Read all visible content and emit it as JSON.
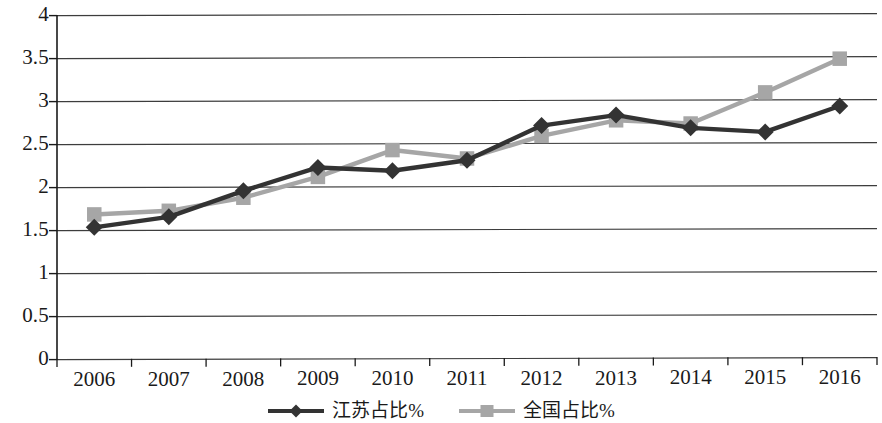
{
  "chart_data": {
    "type": "line",
    "title": "",
    "subtitle": "",
    "xlabel": "",
    "ylabel": "",
    "categories": [
      "2006",
      "2007",
      "2008",
      "2009",
      "2010",
      "2011",
      "2012",
      "2013",
      "2014",
      "2015",
      "2016"
    ],
    "ylim": [
      0,
      4
    ],
    "yticks": [
      "0",
      "0.5",
      "1",
      "1.5",
      "2",
      "2.5",
      "3",
      "3.5",
      "4"
    ],
    "ytick_values": [
      0,
      0.5,
      1,
      1.5,
      2,
      2.5,
      3,
      3.5,
      4
    ],
    "grid": true,
    "grid_axis": "y",
    "legend_position": "bottom",
    "series": [
      {
        "name": "江苏占比%",
        "color": "#333333",
        "marker": "diamond",
        "values": [
          1.53,
          1.65,
          1.95,
          2.22,
          2.18,
          2.3,
          2.7,
          2.82,
          2.67,
          2.62,
          2.92
        ]
      },
      {
        "name": "全国占比%",
        "color": "#a6a6a6",
        "marker": "square",
        "values": [
          1.68,
          1.72,
          1.87,
          2.11,
          2.42,
          2.32,
          2.58,
          2.76,
          2.72,
          3.08,
          3.47
        ]
      }
    ]
  },
  "axes": {
    "y": {
      "ticks": [
        "4",
        "3.5",
        "3",
        "2.5",
        "2",
        "1.5",
        "1",
        "0.5",
        "0"
      ]
    },
    "x": {
      "ticks": [
        "2006",
        "2007",
        "2008",
        "2009",
        "2010",
        "2011",
        "2012",
        "2013",
        "2014",
        "2015",
        "2016"
      ]
    }
  },
  "legend": {
    "items": [
      {
        "label": "江苏占比%",
        "color": "#333333",
        "marker": "diamond"
      },
      {
        "label": "全国占比%",
        "color": "#a6a6a6",
        "marker": "square"
      }
    ]
  },
  "style": {
    "series_dark": "#333333",
    "series_gray": "#a6a6a6",
    "axis_color": "#1a1a1a",
    "grid_color": "#3d3d3d",
    "background": "#ffffff"
  }
}
